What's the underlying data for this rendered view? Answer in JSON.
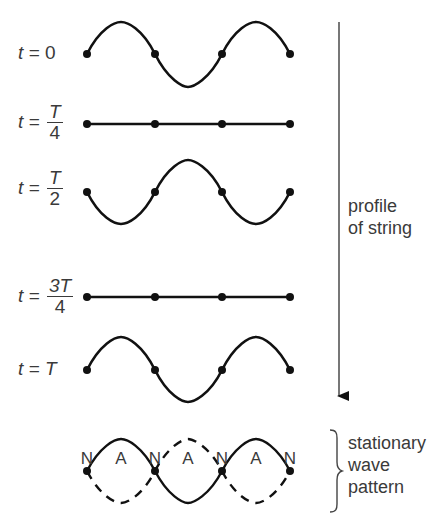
{
  "diagram": {
    "type": "stationary-wave-formation",
    "rows": [
      {
        "label_prefix": "t = ",
        "label_value": "0",
        "profile": "sine-up-first"
      },
      {
        "label_prefix": "t = ",
        "num": "T",
        "den": "4",
        "profile": "flat"
      },
      {
        "label_prefix": "t = ",
        "num": "T",
        "den": "2",
        "profile": "sine-down-first"
      },
      {
        "label_prefix": "t = ",
        "num": "3T",
        "den": "4",
        "profile": "flat"
      },
      {
        "label_prefix": "t = ",
        "label_value": "T",
        "profile": "sine-up-first"
      }
    ],
    "arrow_label_line1": "profile",
    "arrow_label_line2": "of string",
    "node_antinode_labels": [
      "N",
      "A",
      "N",
      "A",
      "N",
      "A",
      "N"
    ],
    "pattern_label_line1": "stationary",
    "pattern_label_line2": "wave",
    "pattern_label_line3": "pattern"
  },
  "colors": {
    "line": "#111111",
    "text": "#3a3a3a",
    "arrow": "#555555"
  }
}
